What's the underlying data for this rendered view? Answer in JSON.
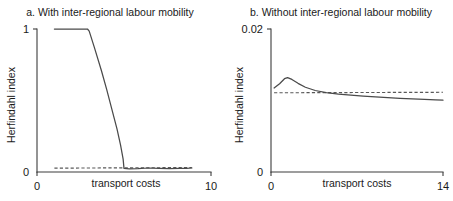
{
  "figure": {
    "background": "#ffffff",
    "line_color": "#4a4a4a",
    "dashed_color": "#585858",
    "axis_color": "#3c3c3c"
  },
  "panels": {
    "a": {
      "title": "a. With inter-regional labour mobility",
      "ylabel": "Herfindahl index",
      "xlabel": "transport costs",
      "y_ticks": [
        "0",
        "1"
      ],
      "x_ticks": [
        "0",
        "10"
      ]
    },
    "b": {
      "title": "b. Without inter-regional labour mobility",
      "ylabel": "Herfindahl index",
      "xlabel": "transport costs",
      "y_ticks": [
        "0",
        "0.02"
      ],
      "x_ticks": [
        "0",
        "14"
      ]
    }
  },
  "chart_data": [
    {
      "type": "line",
      "panel": "a",
      "title": "a. With inter-regional labour mobility",
      "xlabel": "transport costs",
      "ylabel": "Herfindahl index",
      "xlim": [
        0,
        10
      ],
      "ylim": [
        0,
        1
      ],
      "grid": false,
      "legend": "none",
      "series": [
        {
          "name": "Herfindahl index (solid)",
          "style": "solid",
          "x": [
            1.0,
            1.6,
            2.3,
            2.9,
            3.0,
            3.3,
            3.7,
            4.0,
            4.3,
            4.6,
            4.8,
            4.95,
            5.0,
            5.3,
            5.8,
            6.4,
            7.0,
            7.6,
            8.2,
            8.6,
            8.9
          ],
          "y": [
            1.0,
            1.0,
            1.0,
            1.0,
            0.985,
            0.87,
            0.71,
            0.58,
            0.44,
            0.3,
            0.19,
            0.09,
            0.025,
            0.022,
            0.023,
            0.028,
            0.026,
            0.024,
            0.026,
            0.025,
            0.028
          ]
        },
        {
          "name": "reference level (dashed)",
          "style": "dashed",
          "x": [
            1.0,
            8.9
          ],
          "y": [
            0.027,
            0.031
          ]
        }
      ]
    },
    {
      "type": "line",
      "panel": "b",
      "title": "b. Without inter-regional labour mobility",
      "xlabel": "transport costs",
      "ylabel": "Herfindahl index",
      "xlim": [
        0,
        14
      ],
      "ylim": [
        0,
        0.02
      ],
      "grid": false,
      "legend": "none",
      "series": [
        {
          "name": "Herfindahl index (solid)",
          "style": "solid",
          "x": [
            0.25,
            0.7,
            1.1,
            1.35,
            1.7,
            2.2,
            2.8,
            3.6,
            4.5,
            5.5,
            6.5,
            7.5,
            8.5,
            9.5,
            10.5,
            11.5,
            12.5,
            13.4,
            14.0
          ],
          "y": [
            0.01175,
            0.01235,
            0.01305,
            0.0132,
            0.01295,
            0.0124,
            0.01185,
            0.0114,
            0.0111,
            0.0109,
            0.01075,
            0.01062,
            0.0105,
            0.0104,
            0.0103,
            0.01022,
            0.01015,
            0.01008,
            0.01005
          ]
        },
        {
          "name": "reference level (dashed)",
          "style": "dashed",
          "x": [
            0.25,
            14.0
          ],
          "y": [
            0.01108,
            0.01115
          ]
        }
      ]
    }
  ]
}
